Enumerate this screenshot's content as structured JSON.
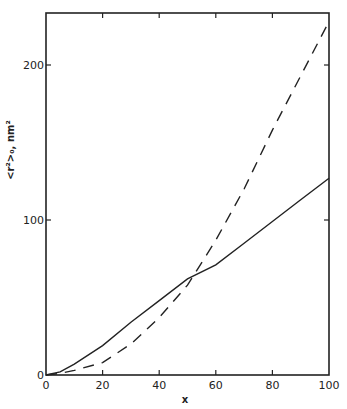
{
  "chart_data": {
    "type": "line",
    "title": "",
    "xlabel": "x",
    "ylabel": "<r²>₀, nm²",
    "xlim": [
      0,
      100
    ],
    "ylim": [
      0,
      235
    ],
    "xticks": [
      0,
      20,
      40,
      60,
      80,
      100
    ],
    "yticks": [
      0,
      100,
      200
    ],
    "grid": false,
    "legend": null,
    "x": [
      0,
      5,
      10,
      20,
      30,
      40,
      50,
      60,
      70,
      80,
      90,
      100
    ],
    "series": [
      {
        "name": "solid",
        "style": "solid",
        "values": [
          0,
          2,
          7,
          19,
          34,
          48,
          62,
          71,
          85,
          99,
          113,
          127
        ]
      },
      {
        "name": "dashed",
        "style": "dashed",
        "values": [
          0,
          1,
          3,
          8,
          20,
          37,
          58,
          87,
          120,
          158,
          193,
          228
        ]
      }
    ]
  }
}
